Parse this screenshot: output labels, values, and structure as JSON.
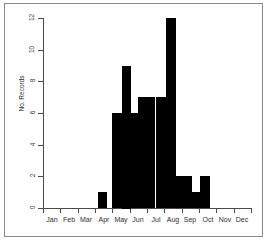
{
  "figure": {
    "kind": "histogram",
    "frame_color": "#8a8a8a",
    "background": "#ffffff",
    "bar_color": "#000000",
    "axis_color": "#4a4a4a"
  },
  "chart_data": {
    "type": "bar",
    "title": "",
    "subtitle": "",
    "xlabel": "",
    "ylabel": "No. Records",
    "xlim": [
      0,
      12
    ],
    "ylim": [
      0,
      12
    ],
    "grid": false,
    "legend": null,
    "annotations": [],
    "x_tick_labels": [
      "Jan",
      "Feb",
      "Mar",
      "Apr",
      "May",
      "Jun",
      "Jul",
      "Aug",
      "Sep",
      "Oct",
      "Nov",
      "Dec"
    ],
    "y_tick_labels": [
      "0",
      "2",
      "4",
      "6",
      "8",
      "10",
      "12"
    ],
    "y_tick_values": [
      0,
      2,
      4,
      6,
      8,
      10,
      12
    ],
    "categories": [
      "Jan",
      "Feb",
      "Mar",
      "Apr",
      "May",
      "Jun",
      "Jul",
      "Aug",
      "Sep",
      "Oct",
      "Nov",
      "Dec"
    ],
    "values": [
      0,
      0,
      0,
      1,
      9,
      6,
      7,
      12,
      1,
      2,
      0,
      0
    ],
    "bins": [
      {
        "label": "Jan",
        "start": 0.0,
        "end": 1.0,
        "value": 0
      },
      {
        "label": "Feb",
        "start": 1.0,
        "end": 2.0,
        "value": 0
      },
      {
        "label": "Mar",
        "start": 2.0,
        "end": 3.0,
        "value": 0
      },
      {
        "label": "Apr-a",
        "start": 3.2,
        "end": 3.7,
        "value": 1
      },
      {
        "label": "May-a",
        "start": 4.0,
        "end": 4.55,
        "value": 6
      },
      {
        "label": "May-b",
        "start": 4.55,
        "end": 5.05,
        "value": 9
      },
      {
        "label": "Jun-a",
        "start": 5.05,
        "end": 5.5,
        "value": 6
      },
      {
        "label": "Jun-b",
        "start": 5.5,
        "end": 6.5,
        "value": 7
      },
      {
        "label": "Jul",
        "start": 6.5,
        "end": 7.1,
        "value": 7
      },
      {
        "label": "Jul-peak",
        "start": 7.1,
        "end": 7.65,
        "value": 12
      },
      {
        "label": "Aug",
        "start": 7.65,
        "end": 8.6,
        "value": 2
      },
      {
        "label": "Sep-a",
        "start": 8.6,
        "end": 9.05,
        "value": 1
      },
      {
        "label": "Sep-b",
        "start": 9.05,
        "end": 9.6,
        "value": 2
      }
    ]
  }
}
